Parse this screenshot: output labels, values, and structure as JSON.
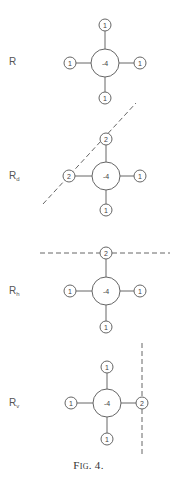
{
  "figure": {
    "caption": "Fig. 4.",
    "panels": [
      {
        "label": "R",
        "subscript": "",
        "center": {
          "value": "-4"
        },
        "neighbors": {
          "top": "1",
          "left": "1",
          "right": "1",
          "bottom": "1"
        },
        "boundary": "none"
      },
      {
        "label": "R",
        "subscript": "d",
        "center": {
          "value": "-4"
        },
        "neighbors": {
          "top": "2",
          "left": "2",
          "right": "1",
          "bottom": "1"
        },
        "boundary": "diagonal dashed line"
      },
      {
        "label": "R",
        "subscript": "h",
        "center": {
          "value": "-4"
        },
        "neighbors": {
          "top": "2",
          "left": "1",
          "right": "1",
          "bottom": "1"
        },
        "boundary": "horizontal dashed line"
      },
      {
        "label": "R",
        "subscript": "v",
        "center": {
          "value": "-4"
        },
        "neighbors": {
          "top": "1",
          "left": "1",
          "right": "2",
          "bottom": "1"
        },
        "boundary": "vertical dashed line"
      }
    ]
  }
}
